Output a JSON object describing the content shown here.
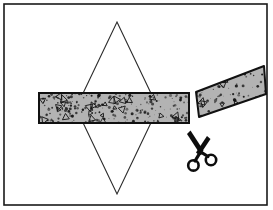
{
  "figure": {
    "description": "Line-art illustration: a tall rhombus (diamond) outline drawn with thin lines, overlaid by a horizontal speckled granular band that has been severed; the right-hand severed piece angles upward to the right, and a pair of scissors sits below the cut.",
    "width": 273,
    "height": 210,
    "background_color": "#ffffff"
  },
  "frame": {
    "name": "border-rectangle",
    "stroke_color": "#1a1a1a",
    "fill_color": "#ffffff",
    "stroke_width": 1.6,
    "x": 4,
    "y": 4,
    "width": 263,
    "height": 201
  },
  "diamond": {
    "name": "rhombus-outline",
    "stroke_color": "#2b2b2b",
    "stroke_width": 1.1,
    "fill": "none",
    "vertices": [
      {
        "label": "top",
        "x": 117,
        "y": 22
      },
      {
        "label": "right",
        "x": 158,
        "y": 108
      },
      {
        "label": "bottom",
        "x": 117,
        "y": 194
      },
      {
        "label": "left",
        "x": 76,
        "y": 108
      }
    ]
  },
  "band_left": {
    "name": "textured-band-left-piece",
    "fill_color": "#b3b3b3",
    "stroke_color": "#111111",
    "stroke_width": 2.0,
    "texture": "speckled-granular-with-triangles",
    "x": 39,
    "y": 93,
    "width": 150,
    "height": 30
  },
  "band_right": {
    "name": "textured-band-right-piece",
    "fill_color": "#b3b3b3",
    "stroke_color": "#111111",
    "stroke_width": 2.0,
    "texture": "speckled-granular-with-triangles",
    "points": "196,92 199,117 266,94 264,66",
    "angle_note": "severed piece tilted upward toward the right edge"
  },
  "cut_gap": {
    "name": "cut-gap",
    "left_edge_x": 189,
    "right_edge_x": 196,
    "note": "white gap separating the two severed band pieces"
  },
  "scissors": {
    "name": "scissors-icon",
    "color": "#0d0d0d",
    "center_x": 200,
    "center_y": 150,
    "orientation": "blades-up-handles-down",
    "handle_radius": 5.2
  },
  "texture_seed": {
    "speck_count": 220,
    "triangle_count": 26,
    "speck_color": "#171717",
    "triangle_stroke": "#171717"
  }
}
